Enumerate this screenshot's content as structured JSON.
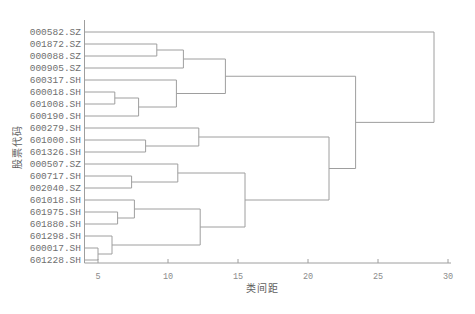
{
  "figure": {
    "background": "#ffffff",
    "line_color": "#9e9e9e",
    "axis_color": "#9e9e9e",
    "leaf_label_color": "#6f6f6f",
    "tick_label_color": "#8b8b8b",
    "title_color": "#5e5e5e"
  },
  "chart_data": {
    "type": "dendrogram",
    "orientation": "left-leaves",
    "title": "",
    "xlabel": "类间距",
    "ylabel": "股票代码",
    "x_ticks": [
      5,
      10,
      15,
      20,
      25,
      30
    ],
    "xlim": [
      4.1,
      30.3
    ],
    "grid": false,
    "legend": false,
    "leaves": [
      "000582.SZ",
      "001872.SZ",
      "000088.SZ",
      "000905.SZ",
      "600317.SH",
      "600018.SH",
      "601008.SH",
      "600190.SH",
      "600279.SH",
      "601000.SH",
      "601326.SH",
      "000507.SZ",
      "600717.SH",
      "002040.SZ",
      "601018.SH",
      "601975.SH",
      "601880.SH",
      "601298.SH",
      "600017.SH",
      "601228.SH"
    ],
    "merges": [
      {
        "id": "M1",
        "children": [
          "L1",
          "L2"
        ],
        "dist": 9.2
      },
      {
        "id": "M2",
        "children": [
          "M1",
          "L3"
        ],
        "dist": 11.1
      },
      {
        "id": "M3",
        "children": [
          "L5",
          "L6"
        ],
        "dist": 6.2
      },
      {
        "id": "M4",
        "children": [
          "M3",
          "L7"
        ],
        "dist": 7.9
      },
      {
        "id": "M5",
        "children": [
          "L4",
          "M4"
        ],
        "dist": 10.6
      },
      {
        "id": "M6",
        "children": [
          "M2",
          "M5"
        ],
        "dist": 14.1
      },
      {
        "id": "M7",
        "children": [
          "L9",
          "L10"
        ],
        "dist": 8.4
      },
      {
        "id": "M8",
        "children": [
          "L8",
          "M7"
        ],
        "dist": 12.2
      },
      {
        "id": "M9",
        "children": [
          "L12",
          "L13"
        ],
        "dist": 7.4
      },
      {
        "id": "M10",
        "children": [
          "L11",
          "M9"
        ],
        "dist": 10.7
      },
      {
        "id": "M11",
        "children": [
          "L15",
          "L16"
        ],
        "dist": 6.4
      },
      {
        "id": "M12",
        "children": [
          "L14",
          "M11"
        ],
        "dist": 7.6
      },
      {
        "id": "M13",
        "children": [
          "L18",
          "L19"
        ],
        "dist": 5.0
      },
      {
        "id": "M14",
        "children": [
          "L17",
          "M13"
        ],
        "dist": 6.0
      },
      {
        "id": "M15",
        "children": [
          "M12",
          "M14"
        ],
        "dist": 12.3
      },
      {
        "id": "M16",
        "children": [
          "M10",
          "M15"
        ],
        "dist": 15.5
      },
      {
        "id": "M17",
        "children": [
          "M8",
          "M16"
        ],
        "dist": 21.5
      },
      {
        "id": "M18",
        "children": [
          "M6",
          "M17"
        ],
        "dist": 23.4
      },
      {
        "id": "M19",
        "children": [
          "L0",
          "M18"
        ],
        "dist": 29.0
      }
    ]
  }
}
